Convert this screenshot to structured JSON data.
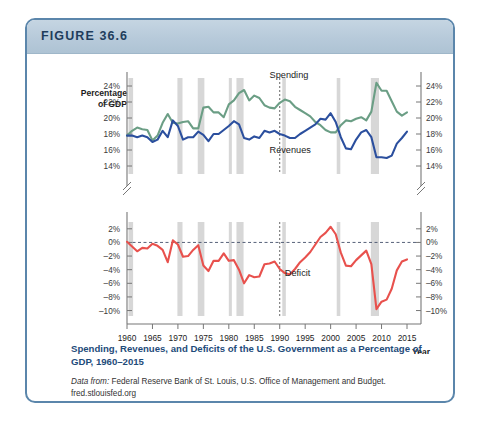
{
  "figure": {
    "header_label": "FIGURE 36.6",
    "caption": "Spending, Revenues, and Deficits of the U.S. Government  as a Percentage of GDP, 1960–2015",
    "source_prefix": "Data from:",
    "source_text": " Federal Reserve Bank of St. Louis, U.S. Office of Management and Budget.",
    "source_url": "fred.stlouisfed.org"
  },
  "colors": {
    "spending": "#6b9e85",
    "revenues": "#2b4f9e",
    "deficit": "#e8514d",
    "recession_band": "#c9c9c9",
    "border": "#5b86ab",
    "header_band": "#b7cada",
    "caption_text": "#1e4b7a"
  },
  "axes": {
    "y_axis_title_line1": "Percentage",
    "y_axis_title_line2": "of GDP",
    "x_axis_label": "Year",
    "upper_ticks": [
      "24%",
      "22%",
      "20%",
      "18%",
      "16%",
      "14%"
    ],
    "lower_ticks": [
      "2%",
      "0%",
      "–2%",
      "–4%",
      "–6%",
      "–8%",
      "–10%"
    ],
    "x_ticks": [
      "1960",
      "1965",
      "1970",
      "1975",
      "1980",
      "1985",
      "1990",
      "1995",
      "2000",
      "2005",
      "2010",
      "2015"
    ]
  },
  "series_labels": {
    "spending": "Spending",
    "revenues": "Revenues",
    "deficit": "Deficit"
  },
  "chart_data": {
    "type": "line",
    "title": "Spending, Revenues, and Deficits of the U.S. Government as a Percentage of GDP, 1960–2015",
    "xlabel": "Year",
    "ylabel": "Percentage of GDP",
    "grid": false,
    "legend": "inline-labels",
    "xlim": [
      1960,
      2015
    ],
    "panels": [
      {
        "name": "upper",
        "ylim": [
          13,
          25
        ],
        "yticks": [
          14,
          16,
          18,
          20,
          22,
          24
        ],
        "axis_break": true
      },
      {
        "name": "lower",
        "ylim": [
          -10.8,
          3
        ],
        "yticks": [
          2,
          0,
          -2,
          -4,
          -6,
          -8,
          -10
        ],
        "zero_line": 0
      }
    ],
    "x": [
      1960,
      1961,
      1962,
      1963,
      1964,
      1965,
      1966,
      1967,
      1968,
      1969,
      1970,
      1971,
      1972,
      1973,
      1974,
      1975,
      1976,
      1977,
      1978,
      1979,
      1980,
      1981,
      1982,
      1983,
      1984,
      1985,
      1986,
      1987,
      1988,
      1989,
      1990,
      1991,
      1992,
      1993,
      1994,
      1995,
      1996,
      1997,
      1998,
      1999,
      2000,
      2001,
      2002,
      2003,
      2004,
      2005,
      2006,
      2007,
      2008,
      2009,
      2010,
      2011,
      2012,
      2013,
      2014,
      2015
    ],
    "series": [
      {
        "name": "Spending",
        "panel": "upper",
        "color": "#6b9e85",
        "values": [
          17.8,
          18.4,
          18.8,
          18.6,
          18.5,
          17.2,
          17.8,
          19.4,
          20.5,
          19.4,
          19.3,
          19.5,
          19.6,
          18.7,
          18.7,
          21.3,
          21.4,
          20.7,
          20.7,
          20.1,
          21.7,
          22.2,
          23.1,
          23.5,
          22.2,
          22.8,
          22.5,
          21.6,
          21.3,
          21.2,
          21.9,
          22.3,
          22.1,
          21.4,
          21.0,
          20.6,
          20.2,
          19.5,
          19.1,
          18.5,
          18.2,
          18.2,
          19.1,
          19.7,
          19.6,
          19.9,
          20.1,
          19.7,
          20.8,
          24.4,
          23.4,
          23.4,
          22.1,
          20.8,
          20.3,
          20.7
        ]
      },
      {
        "name": "Revenues",
        "panel": "upper",
        "color": "#2b4f9e",
        "values": [
          17.8,
          17.8,
          17.6,
          17.8,
          17.6,
          17.0,
          17.3,
          18.4,
          17.6,
          19.7,
          19.0,
          17.3,
          17.6,
          17.6,
          18.3,
          17.9,
          17.1,
          18.0,
          18.0,
          18.5,
          19.0,
          19.6,
          19.2,
          17.5,
          17.3,
          17.7,
          17.5,
          18.4,
          18.2,
          18.4,
          18.0,
          17.8,
          17.5,
          17.5,
          18.0,
          18.4,
          18.8,
          19.2,
          19.9,
          19.8,
          20.6,
          19.5,
          17.6,
          16.2,
          16.1,
          17.3,
          18.2,
          18.5,
          17.6,
          15.1,
          15.1,
          15.0,
          15.3,
          16.8,
          17.5,
          18.3
        ]
      },
      {
        "name": "Deficit",
        "panel": "lower",
        "color": "#e8514d",
        "values": [
          0.1,
          -0.6,
          -1.3,
          -0.8,
          -0.9,
          -0.2,
          -0.5,
          -1.1,
          -2.9,
          0.3,
          -0.3,
          -2.1,
          -2.0,
          -1.1,
          -0.4,
          -3.4,
          -4.2,
          -2.7,
          -2.7,
          -1.6,
          -2.7,
          -2.6,
          -4.0,
          -6.0,
          -4.8,
          -5.1,
          -5.0,
          -3.2,
          -3.1,
          -2.8,
          -3.9,
          -4.5,
          -4.7,
          -3.9,
          -2.9,
          -2.2,
          -1.4,
          -0.3,
          0.8,
          1.4,
          2.3,
          1.2,
          -1.5,
          -3.4,
          -3.5,
          -2.6,
          -1.9,
          -1.2,
          -3.2,
          -9.8,
          -8.7,
          -8.4,
          -6.8,
          -4.1,
          -2.8,
          -2.5
        ]
      }
    ],
    "recession_bands": [
      [
        1960.3,
        1961.2
      ],
      [
        1969.9,
        1970.9
      ],
      [
        1973.9,
        1975.2
      ],
      [
        1980.0,
        1980.6
      ],
      [
        1981.5,
        1982.9
      ],
      [
        1990.5,
        1991.2
      ],
      [
        2001.2,
        2001.9
      ],
      [
        2007.9,
        2009.5
      ]
    ],
    "reference_line_year": 1990
  }
}
